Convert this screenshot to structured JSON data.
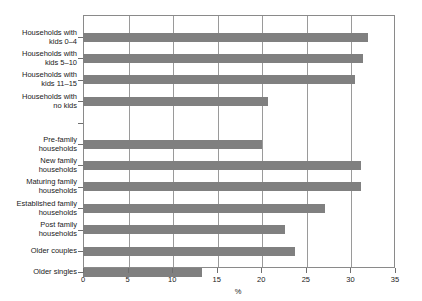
{
  "chart_data": {
    "type": "bar",
    "orientation": "horizontal",
    "title": "",
    "subtitle": "",
    "xlabel": "%",
    "ylabel": "",
    "xlim": [
      0,
      35
    ],
    "xticks": [
      0,
      5,
      10,
      15,
      20,
      25,
      30,
      35
    ],
    "xtick_labels": [
      "0",
      "5",
      "10",
      "15",
      "20",
      "25",
      "30",
      "35"
    ],
    "grid": "vertical",
    "legend": "none",
    "bar_color": "#808080",
    "axis_color": "#8a8a8a",
    "categories": [
      "Households with\nkids 0–4",
      "Households with\nkids 5–10",
      "Households with\nkids 11–15",
      "Households with\nno kids",
      "",
      "Pre-family\nhouseholds",
      "New family\nhouseholds",
      "Maturing family\nhouseholds",
      "Established family\nhouseholds",
      "Post family\nhouseholds",
      "Older couples",
      "Older singles"
    ],
    "values": [
      32.0,
      31.4,
      30.5,
      20.7,
      null,
      20.1,
      31.2,
      31.2,
      27.2,
      22.7,
      23.8,
      13.4
    ]
  }
}
